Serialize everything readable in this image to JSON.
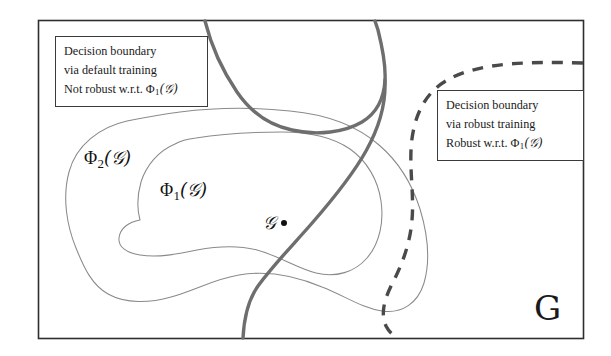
{
  "figure": {
    "frame": {
      "color": "#2e2e2e",
      "x": 38,
      "y": 20,
      "width": 545,
      "height": 318
    },
    "background": "#ffffff"
  },
  "callouts": [
    {
      "id": "default-training",
      "lines": [
        "Decision boundary",
        "via default training",
        "Not robust w.r.t. "
      ],
      "formula_prefix": "Φ",
      "formula_sub": "1",
      "formula_arg": "(𝒢)",
      "border_color": "#3a3a3a"
    },
    {
      "id": "robust-training",
      "lines": [
        "Decision boundary",
        "via robust training",
        "Robust w.r.t. "
      ],
      "formula_prefix": "Φ",
      "formula_sub": "1",
      "formula_arg": "(𝒢)",
      "border_color": "#3a3a3a"
    }
  ],
  "labels": {
    "phi2": {
      "prefix": "Φ",
      "sub": "2",
      "arg": "(𝒢)"
    },
    "phi1": {
      "prefix": "Φ",
      "sub": "1",
      "arg": "(𝒢)"
    },
    "point_g": "𝒢",
    "universe_g": "G"
  },
  "curves": {
    "default_boundary": {
      "name": "decision boundary via default training",
      "style": "solid",
      "color": "#6e6e6e",
      "width": 3.4,
      "enters_top_at_x": 205,
      "exits_bottom_at_x": 243
    },
    "robust_boundary": {
      "name": "decision boundary via robust training",
      "style": "dashed",
      "color": "#4a4a4a",
      "width": 3.4,
      "dash": "11 9",
      "enters_right_at_y": 63,
      "exits_bottom_at_x": 397
    },
    "phi2_region": {
      "name": "outer perturbation set",
      "style": "solid",
      "color": "#8a8a8a",
      "width": 1.0
    },
    "phi1_region": {
      "name": "inner perturbation set",
      "style": "solid",
      "color": "#8a8a8a",
      "width": 1.0
    }
  }
}
